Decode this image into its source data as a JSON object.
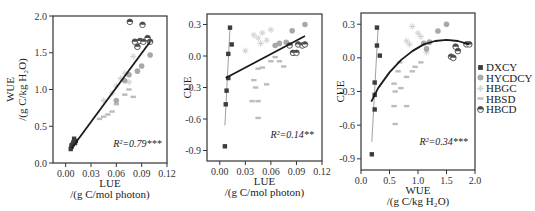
{
  "chart_data": [
    {
      "type": "scatter",
      "panel": "left",
      "title": "",
      "xlabel": "LUE",
      "xlabel_unit": "/(g C/mol photon)",
      "ylabel": "WUE",
      "ylabel_unit": "/(g C/kg H₂O)",
      "xlim": [
        -0.015,
        0.12
      ],
      "ylim": [
        0.0,
        2.0
      ],
      "xticks": [
        "0.00",
        "0.03",
        "0.06",
        "0.09",
        "0.12"
      ],
      "yticks": [
        "0.0",
        "0.5",
        "1.0",
        "1.5",
        "2.0"
      ],
      "annotation": {
        "text": "R²=0.79***",
        "x": 0.085,
        "y": 0.22
      },
      "fit": {
        "type": "linear",
        "x": [
          0.007,
          0.1
        ],
        "y": [
          0.2,
          1.65
        ],
        "r2": 0.79,
        "significance": "***"
      },
      "series": [
        {
          "name": "DXCY",
          "points": [
            [
              0.006,
              0.19
            ],
            [
              0.007,
              0.22
            ],
            [
              0.008,
              0.25
            ],
            [
              0.009,
              0.28
            ],
            [
              0.01,
              0.33
            ],
            [
              0.011,
              0.27
            ],
            [
              0.012,
              0.3
            ],
            [
              0.007,
              0.24
            ]
          ]
        },
        {
          "name": "HYCDCY",
          "points": [
            [
              0.06,
              0.85
            ],
            [
              0.07,
              1.12
            ],
            [
              0.075,
              1.2
            ],
            [
              0.09,
              1.32
            ],
            [
              0.1,
              1.47
            ],
            [
              0.085,
              1.25
            ]
          ]
        },
        {
          "name": "HBGC",
          "points": [
            [
              0.045,
              0.85
            ],
            [
              0.06,
              1.05
            ],
            [
              0.065,
              1.15
            ],
            [
              0.07,
              1.22
            ],
            [
              0.075,
              1.1
            ],
            [
              0.08,
              1.45
            ],
            [
              0.055,
              0.95
            ]
          ]
        },
        {
          "name": "HBSD",
          "points": [
            [
              0.04,
              0.6
            ],
            [
              0.045,
              0.63
            ],
            [
              0.05,
              0.66
            ],
            [
              0.055,
              0.7
            ],
            [
              0.06,
              0.8
            ],
            [
              0.07,
              0.93
            ],
            [
              0.075,
              1.0
            ],
            [
              0.08,
              0.9
            ]
          ]
        },
        {
          "name": "HBCD",
          "points": [
            [
              0.076,
              1.92
            ],
            [
              0.091,
              1.88
            ],
            [
              0.082,
              1.65
            ],
            [
              0.085,
              1.58
            ],
            [
              0.088,
              1.66
            ],
            [
              0.092,
              1.65
            ],
            [
              0.097,
              1.7
            ],
            [
              0.1,
              1.65
            ]
          ]
        }
      ]
    },
    {
      "type": "scatter",
      "panel": "middle",
      "title": "",
      "xlabel": "LUE",
      "xlabel_unit": "/(g C/mol photon)",
      "ylabel": "CUE",
      "xlim": [
        -0.015,
        0.12
      ],
      "ylim": [
        -1.0,
        0.4
      ],
      "xticks": [
        "0.00",
        "0.03",
        "0.06",
        "0.09",
        "0.12"
      ],
      "yticks": [
        "-0.9",
        "-0.6",
        "-0.3",
        "0.0",
        "0.3"
      ],
      "annotation": {
        "text": "R²=0.14**",
        "x": 0.085,
        "y": -0.78
      },
      "fit": {
        "type": "linear",
        "x": [
          0.007,
          0.1
        ],
        "y": [
          -0.21,
          0.19
        ],
        "r2": 0.14,
        "significance": "**"
      },
      "series": [
        {
          "name": "DXCY",
          "points": [
            [
              0.012,
              0.27
            ],
            [
              0.014,
              0.11
            ],
            [
              0.01,
              0.02
            ],
            [
              0.01,
              -0.21
            ],
            [
              0.008,
              -0.33
            ],
            [
              0.007,
              -0.46
            ],
            [
              0.006,
              -0.86
            ]
          ],
          "fit": {
            "x": [
              0.006,
              0.012
            ],
            "y": [
              -0.66,
              0.27
            ]
          }
        },
        {
          "name": "HYCDCY",
          "points": [
            [
              0.065,
              0.1
            ],
            [
              0.07,
              0.12
            ],
            [
              0.085,
              0.24
            ],
            [
              0.1,
              0.3
            ],
            [
              0.078,
              0.13
            ]
          ]
        },
        {
          "name": "HBGC",
          "points": [
            [
              0.04,
              0.2
            ],
            [
              0.045,
              0.17
            ],
            [
              0.05,
              0.22
            ],
            [
              0.055,
              0.15
            ],
            [
              0.06,
              0.25
            ],
            [
              0.03,
              0.05
            ],
            [
              0.048,
              0.12
            ]
          ]
        },
        {
          "name": "HBSD",
          "points": [
            [
              0.04,
              -0.23
            ],
            [
              0.045,
              -0.12
            ],
            [
              0.05,
              -0.11
            ],
            [
              0.055,
              -0.27
            ],
            [
              0.06,
              -0.05
            ],
            [
              0.065,
              -0.01
            ],
            [
              0.07,
              -0.05
            ],
            [
              0.075,
              -0.1
            ],
            [
              0.038,
              -0.43
            ],
            [
              0.045,
              -0.43
            ],
            [
              0.045,
              -0.59
            ],
            [
              0.042,
              -0.3
            ]
          ]
        },
        {
          "name": "HBCD",
          "points": [
            [
              0.082,
              0.1
            ],
            [
              0.086,
              0.03
            ],
            [
              0.09,
              0.03
            ],
            [
              0.092,
              0.11
            ],
            [
              0.097,
              0.1
            ],
            [
              0.1,
              0.11
            ]
          ]
        }
      ]
    },
    {
      "type": "scatter",
      "panel": "right",
      "title": "",
      "xlabel": "WUE",
      "xlabel_unit": "/(g C/kg H₂O)",
      "ylabel": "CUE",
      "xlim": [
        0.0,
        2.0
      ],
      "ylim": [
        -1.0,
        0.4
      ],
      "xticks": [
        "0.0",
        "0.5",
        "1.0",
        "1.5",
        "2.0"
      ],
      "yticks": [
        "-0.9",
        "-0.6",
        "-0.3",
        "0.0",
        "0.3"
      ],
      "annotation": {
        "text": "R²=0.34***",
        "x": 1.45,
        "y": -0.78
      },
      "fit": {
        "type": "quadratic",
        "x": [
          0.18,
          0.3,
          0.5,
          0.7,
          0.9,
          1.1,
          1.3,
          1.5,
          1.7,
          1.9
        ],
        "y": [
          -0.39,
          -0.27,
          -0.13,
          -0.02,
          0.06,
          0.12,
          0.15,
          0.16,
          0.15,
          0.12
        ],
        "r2": 0.34,
        "significance": "***"
      },
      "series": [
        {
          "name": "DXCY",
          "points": [
            [
              0.28,
              0.27
            ],
            [
              0.28,
              0.11
            ],
            [
              0.33,
              0.02
            ],
            [
              0.24,
              -0.22
            ],
            [
              0.24,
              -0.33
            ],
            [
              0.24,
              -0.46
            ],
            [
              0.19,
              -0.86
            ]
          ],
          "fit": {
            "x": [
              0.19,
              0.3
            ],
            "y": [
              -0.75,
              0.27
            ]
          }
        },
        {
          "name": "HYCDCY",
          "points": [
            [
              1.1,
              0.13
            ],
            [
              1.15,
              0.08
            ],
            [
              1.2,
              0.14
            ],
            [
              1.35,
              0.24
            ],
            [
              1.5,
              0.3
            ],
            [
              1.62,
              0.0
            ]
          ]
        },
        {
          "name": "HBGC",
          "points": [
            [
              0.8,
              0.15
            ],
            [
              0.9,
              0.28
            ],
            [
              1.0,
              0.22
            ],
            [
              1.05,
              0.19
            ],
            [
              0.85,
              0.12
            ],
            [
              1.15,
              0.05
            ]
          ]
        },
        {
          "name": "HBSD",
          "points": [
            [
              0.58,
              -0.23
            ],
            [
              0.6,
              -0.3
            ],
            [
              0.65,
              -0.12
            ],
            [
              0.68,
              -0.04
            ],
            [
              0.7,
              -0.27
            ],
            [
              0.8,
              -0.17
            ],
            [
              0.9,
              -0.12
            ],
            [
              0.95,
              -0.08
            ],
            [
              1.05,
              -0.04
            ],
            [
              0.58,
              -0.43
            ],
            [
              0.6,
              -0.59
            ],
            [
              0.8,
              -0.43
            ]
          ]
        },
        {
          "name": "HBCD",
          "points": [
            [
              1.58,
              0.01
            ],
            [
              1.62,
              0.0
            ],
            [
              1.66,
              0.1
            ],
            [
              1.7,
              0.06
            ],
            [
              1.85,
              0.12
            ],
            [
              1.9,
              0.12
            ]
          ]
        }
      ]
    }
  ],
  "legend": {
    "position": "right",
    "items": [
      {
        "name": "DXCY",
        "marker": "square",
        "color": "#3c3c3c"
      },
      {
        "name": "HYCDCY",
        "marker": "circle",
        "color": "#a8a8a8"
      },
      {
        "name": "HBGC",
        "marker": "star",
        "color": "#d2d2d2"
      },
      {
        "name": "HBSD",
        "marker": "bar",
        "color": "#bcbcbc"
      },
      {
        "name": "HBCD",
        "marker": "half-circle",
        "color": "#4a4a4a"
      }
    ]
  },
  "styles": {
    "axis_color": "#333333",
    "fit_color": "#1a1a1a",
    "group_fit_color": "#888888"
  }
}
